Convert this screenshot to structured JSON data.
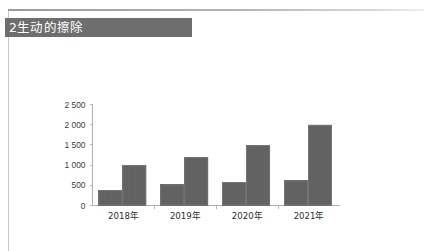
{
  "document": {
    "heading": "2生动的擦除"
  },
  "chart_data": {
    "type": "bar",
    "title": "",
    "xlabel": "",
    "ylabel": "",
    "categories": [
      "2018年",
      "2019年",
      "2020年",
      "2021年"
    ],
    "series": [
      {
        "name": "系列1",
        "values": [
          380,
          520,
          580,
          620
        ],
        "color": "#646464"
      },
      {
        "name": "系列2",
        "values": [
          1000,
          1200,
          1500,
          2000
        ],
        "color": "#646464"
      }
    ],
    "ylim": [
      0,
      2500
    ],
    "ytick_step": 500,
    "ytick_labels": [
      "0",
      "500",
      "1 000",
      "1 500",
      "2 000",
      "2 500"
    ],
    "ytick_values": [
      0,
      500,
      1000,
      1500,
      2000,
      2500
    ],
    "grid": false,
    "legend": "none",
    "bar_color": "#646464",
    "axis_color": "#b0b0b0"
  }
}
